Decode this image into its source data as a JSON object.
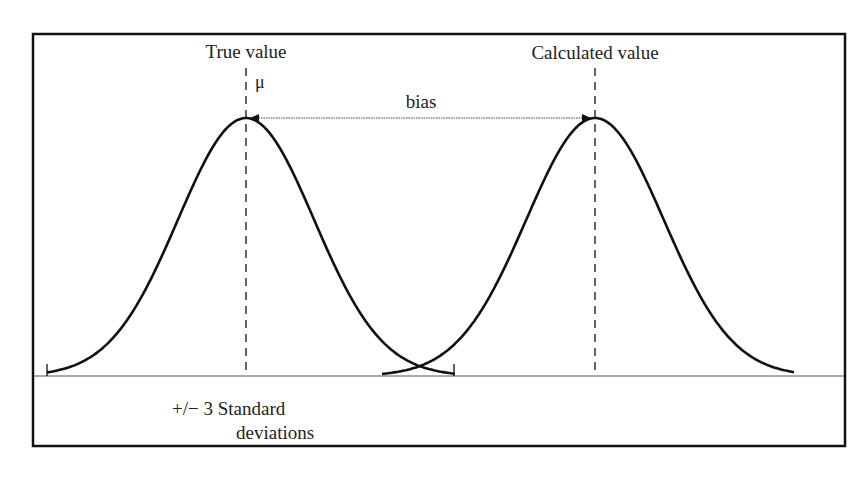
{
  "diagram": {
    "title_left": "True value",
    "title_right": "Calculated value",
    "mu_symbol": "μ",
    "bias_label": "bias",
    "range_label_line1": "+/− 3 Standard",
    "range_label_line2": "deviations",
    "colors": {
      "stroke": "#111111",
      "text": "#222222",
      "background": "#ffffff"
    },
    "curves": [
      {
        "name": "true-distribution",
        "center_x": 246,
        "peak_y": 118,
        "start_x": 47,
        "end_x": 455
      },
      {
        "name": "calculated-distribution",
        "center_x": 595,
        "peak_y": 118,
        "start_x": 382,
        "end_x": 794
      }
    ],
    "baseline_y": 376
  }
}
